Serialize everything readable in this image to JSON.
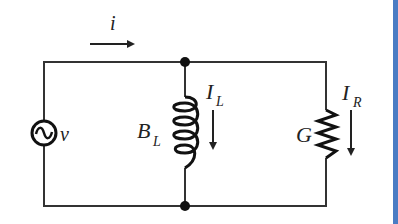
{
  "diagram": {
    "type": "parallel RL circuit (admittance form)",
    "colors": {
      "wire": "#333333",
      "accent_bar": "#4a7cc4",
      "background": "#ffffff"
    },
    "source": {
      "symbol": "ac-voltage-source",
      "label": "v"
    },
    "current_total": {
      "label": "i",
      "direction": "right"
    },
    "inductor": {
      "label": "B",
      "label_sub": "L",
      "current_label": "I",
      "current_sub": "L",
      "current_direction": "down"
    },
    "resistor": {
      "label": "G",
      "current_label": "I",
      "current_sub": "R",
      "current_direction": "down"
    }
  }
}
